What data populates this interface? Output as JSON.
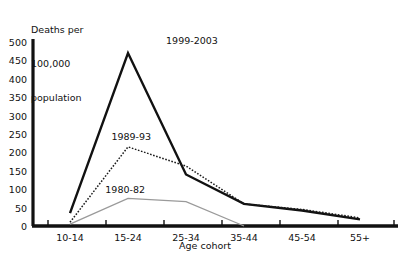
{
  "chart_data": {
    "type": "line",
    "title": "",
    "xlabel": "Age cohort",
    "ylabel": "Deaths per\n100,000\npopulation",
    "ylabel_lines": [
      "Deaths per",
      "100,000",
      "population"
    ],
    "categories": [
      "10-14",
      "15-24",
      "25-34",
      "35-44",
      "45-54",
      "55+"
    ],
    "ylim": [
      0,
      500
    ],
    "yticks": [
      0,
      50,
      100,
      150,
      200,
      250,
      300,
      350,
      400,
      450,
      500
    ],
    "ytick_labels": [
      "0",
      "50",
      "100",
      "150",
      "200",
      "250",
      "300",
      "350",
      "400",
      "450",
      "500"
    ],
    "grid": false,
    "legend": "inline-annotations",
    "series": [
      {
        "name": "1999-2003",
        "style": "solid-thick-black",
        "color": "#111111",
        "values": [
          35,
          470,
          140,
          60,
          42,
          18
        ],
        "label_x_pct": 41.0,
        "label_y_pct": 13.6
      },
      {
        "name": "1989-93",
        "style": "dotted-black",
        "color": "#1a1a1a",
        "values": [
          10,
          215,
          163,
          60,
          45,
          22
        ],
        "label_x_pct": 27.5,
        "label_y_pct": 51.0
      },
      {
        "name": "1980-82",
        "style": "solid-thin-gray",
        "color": "#9a9a9a",
        "values": [
          5,
          75,
          66,
          0,
          null,
          null
        ],
        "label_x_pct": 26.0,
        "label_y_pct": 71.5
      }
    ]
  },
  "axis": {
    "axis_color": "#111111",
    "tick_color": "#111111"
  }
}
